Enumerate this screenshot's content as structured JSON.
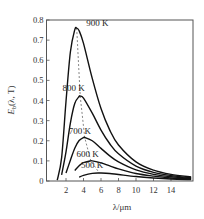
{
  "chart_data": {
    "type": "line",
    "title": "",
    "xlabel": "λ/μm",
    "ylabel": "Eb(λ, T)",
    "ylabel_main": "E",
    "ylabel_sub": "b",
    "ylabel_rest": "(λ, T)",
    "xlim": [
      0,
      16.3
    ],
    "ylim": [
      0,
      0.8
    ],
    "grid": false,
    "legend": "inline labels near peaks",
    "xticks": [
      2,
      4,
      6,
      8,
      10,
      12,
      14
    ],
    "xtick_labels": [
      "2",
      "4",
      "6",
      "8",
      "10",
      "12",
      "14"
    ],
    "yticks": [
      0,
      0.1,
      0.2,
      0.3,
      0.4,
      0.5,
      0.6,
      0.7,
      0.8
    ],
    "ytick_labels": [
      "0",
      "0.1",
      "0.2",
      "0.3",
      "0.4",
      "0.5",
      "0.6",
      "0.7",
      "0.8"
    ],
    "series": [
      {
        "name": "900 K",
        "label_pos": [
          4.3,
          0.77
        ],
        "x": [
          1.0,
          1.5,
          2.0,
          2.5,
          3.0,
          3.22,
          3.5,
          4.0,
          5.0,
          6.0,
          7.0,
          8.0,
          10.0,
          12.0,
          14.0,
          16.3
        ],
        "y": [
          0.004,
          0.116,
          0.395,
          0.641,
          0.751,
          0.76,
          0.747,
          0.684,
          0.51,
          0.36,
          0.253,
          0.179,
          0.095,
          0.054,
          0.033,
          0.02
        ]
      },
      {
        "name": "800 K",
        "label_pos": [
          1.6,
          0.445
        ],
        "x": [
          1.5,
          2.0,
          2.5,
          3.0,
          3.5,
          3.62,
          4.0,
          5.0,
          6.0,
          7.0,
          8.0,
          10.0,
          12.0,
          14.0,
          16.3
        ],
        "y": [
          0.031,
          0.145,
          0.288,
          0.385,
          0.42,
          0.422,
          0.412,
          0.337,
          0.253,
          0.185,
          0.135,
          0.074,
          0.043,
          0.027,
          0.016
        ]
      },
      {
        "name": "700 K",
        "label_pos": [
          2.3,
          0.235
        ],
        "x": [
          2.0,
          2.5,
          3.0,
          3.5,
          4.0,
          4.14,
          5.0,
          6.0,
          7.0,
          8.0,
          10.0,
          12.0,
          14.0,
          16.3
        ],
        "y": [
          0.04,
          0.103,
          0.163,
          0.201,
          0.216,
          0.216,
          0.2,
          0.162,
          0.125,
          0.095,
          0.055,
          0.033,
          0.021,
          0.013
        ]
      },
      {
        "name": "600 K",
        "label_pos": [
          3.2,
          0.12
        ],
        "x": [
          3.0,
          3.5,
          4.0,
          4.83,
          5.0,
          6.0,
          7.0,
          8.0,
          10.0,
          12.0,
          14.0,
          16.3
        ],
        "y": [
          0.052,
          0.076,
          0.091,
          0.1,
          0.1,
          0.09,
          0.075,
          0.06,
          0.037,
          0.024,
          0.015,
          0.01
        ]
      },
      {
        "name": "500 K",
        "label_pos": [
          3.7,
          0.066
        ],
        "x": [
          3.5,
          4.0,
          5.0,
          5.8,
          6.0,
          7.0,
          8.0,
          10.0,
          12.0,
          14.0,
          16.3
        ],
        "y": [
          0.019,
          0.028,
          0.038,
          0.04,
          0.04,
          0.037,
          0.032,
          0.022,
          0.015,
          0.01,
          0.007
        ]
      }
    ],
    "annotations": [
      {
        "type": "dashed-line",
        "name": "Wien displacement (peak locus)",
        "x": [
          3.22,
          3.62,
          4.14,
          4.83,
          5.8
        ],
        "y": [
          0.76,
          0.422,
          0.216,
          0.1,
          0.04
        ]
      }
    ]
  },
  "colors": {
    "curve": "#111111",
    "frame": "#555555",
    "dashed": "#666666",
    "text": "#333333"
  }
}
